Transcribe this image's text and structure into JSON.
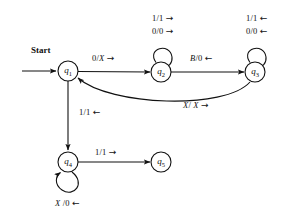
{
  "diagram": {
    "type": "state-transition-diagram",
    "title": "",
    "start_label": "Start",
    "states": [
      {
        "id": "q1",
        "label": "q",
        "sub": "1",
        "cx": 68,
        "cy": 71
      },
      {
        "id": "q2",
        "label": "q",
        "sub": "2",
        "cx": 161,
        "cy": 72
      },
      {
        "id": "q3",
        "label": "q",
        "sub": "3",
        "cx": 255,
        "cy": 72
      },
      {
        "id": "q4",
        "label": "q",
        "sub": "4",
        "cx": 68,
        "cy": 162
      },
      {
        "id": "q5",
        "label": "q",
        "sub": "5",
        "cx": 161,
        "cy": 162
      }
    ],
    "transitions": [
      {
        "from": "q1",
        "to": "q2",
        "read": "0",
        "write": "X",
        "label": "0/X",
        "arrow": "right"
      },
      {
        "from": "q2",
        "to": "q2",
        "read": "1",
        "write": "1",
        "label": "1/1",
        "arrow": "right"
      },
      {
        "from": "q2",
        "to": "q2",
        "read": "0",
        "write": "0",
        "label": "0/0",
        "arrow": "right"
      },
      {
        "from": "q2",
        "to": "q3",
        "read": "B",
        "write": "0",
        "label": "B/0",
        "arrow": "left"
      },
      {
        "from": "q3",
        "to": "q3",
        "read": "1",
        "write": "1",
        "label": "1/1",
        "arrow": "left"
      },
      {
        "from": "q3",
        "to": "q3",
        "read": "0",
        "write": "0",
        "label": "0/0",
        "arrow": "left"
      },
      {
        "from": "q3",
        "to": "q1",
        "read": "X",
        "write": "X",
        "label": "X/ X",
        "arrow": "right"
      },
      {
        "from": "q1",
        "to": "q4",
        "read": "1",
        "write": "1",
        "label": "1/1",
        "arrow": "left"
      },
      {
        "from": "q4",
        "to": "q5",
        "read": "1",
        "write": "1",
        "label": "1/1",
        "arrow": "right"
      },
      {
        "from": "q4",
        "to": "q4",
        "read": "X",
        "write": "0",
        "label": "X /0",
        "arrow": "left"
      }
    ],
    "labels": {
      "q2_loop_top": {
        "text": "1/1",
        "arrow": "→"
      },
      "q2_loop_bot": {
        "text": "0/0",
        "arrow": "→"
      },
      "q3_loop_top": {
        "text": "1/1",
        "arrow": "←"
      },
      "q3_loop_bot": {
        "text": "0/0",
        "arrow": "←"
      },
      "q1_q2_edge": {
        "pre": "0/",
        "it": "X",
        "arrow": "→"
      },
      "q2_q3_edge": {
        "it": "B",
        "post": "/0",
        "arrow": "←"
      },
      "q3_q1_arc": {
        "it1": "X",
        "mid": "/ ",
        "it2": "X",
        "arrow": "→"
      },
      "q1_q4_edge": {
        "text": "1/1",
        "arrow": "←"
      },
      "q4_q5_edge": {
        "text": "1/1",
        "arrow": "→"
      },
      "q4_loop": {
        "it": "X",
        "post": " /0",
        "arrow": "←"
      }
    },
    "colors": {
      "ink": "#111111",
      "background": "#ffffff"
    }
  }
}
